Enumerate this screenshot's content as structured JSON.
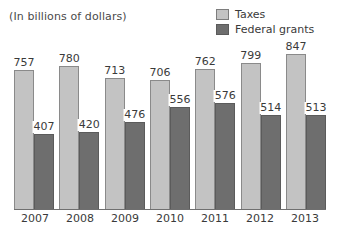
{
  "header": {
    "unit_note": "(In billions of dollars)"
  },
  "legend": {
    "position": "top-right",
    "items": [
      {
        "label": "Taxes",
        "color": "#c3c3c3",
        "swatch_name": "legend-swatch-taxes"
      },
      {
        "label": "Federal grants",
        "color": "#6e6e6e",
        "swatch_name": "legend-swatch-federal-grants"
      }
    ]
  },
  "chart_data": {
    "type": "bar",
    "title": "",
    "subtitle": "",
    "xlabel": "",
    "ylabel": "",
    "unit_note": "(In billions of dollars)",
    "categories": [
      "2007",
      "2008",
      "2009",
      "2010",
      "2011",
      "2012",
      "2013"
    ],
    "series": [
      {
        "name": "Taxes",
        "color": "#c3c3c3",
        "values": [
          757,
          780,
          713,
          706,
          762,
          799,
          847
        ]
      },
      {
        "name": "Federal grants",
        "color": "#6e6e6e",
        "values": [
          407,
          420,
          476,
          556,
          576,
          514,
          513
        ]
      }
    ],
    "ylim": [
      0,
      900
    ],
    "grid": false,
    "legend_position": "top-right",
    "data_labels": true
  }
}
